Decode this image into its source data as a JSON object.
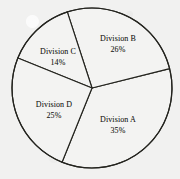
{
  "chart_data": {
    "type": "pie",
    "title": "",
    "subtitle": "",
    "xlabel": "",
    "ylabel": "",
    "legend": "none",
    "grid": false,
    "labels_inside_slices": true,
    "categories": [
      "Division A",
      "Division B",
      "Division C",
      "Division D"
    ],
    "values": [
      35,
      26,
      14,
      25
    ],
    "units": "%",
    "total": 100,
    "slices": [
      {
        "name": "Division A",
        "value": 35,
        "value_text": "35%",
        "start_angle_deg": 76,
        "end_angle_deg": 202,
        "label_x": 118,
        "label_y": 125
      },
      {
        "name": "Division B",
        "value": 26,
        "value_text": "26%",
        "start_angle_deg": 342,
        "end_angle_deg": 76,
        "label_x": 118,
        "label_y": 44
      },
      {
        "name": "Division C",
        "value": 14,
        "value_text": "14%",
        "start_angle_deg": 292,
        "end_angle_deg": 342,
        "label_x": 58,
        "label_y": 57
      },
      {
        "name": "Division D",
        "value": 25,
        "value_text": "25%",
        "start_angle_deg": 202,
        "end_angle_deg": 292,
        "label_x": 54,
        "label_y": 110
      }
    ],
    "geometry": {
      "center_x": 92,
      "center_y": 88,
      "radius": 80
    },
    "colors": {
      "background": "#f1f1f0",
      "slice_fill": "#f3f3f2",
      "stroke": "#24241f",
      "text": "#1c1c18"
    }
  }
}
